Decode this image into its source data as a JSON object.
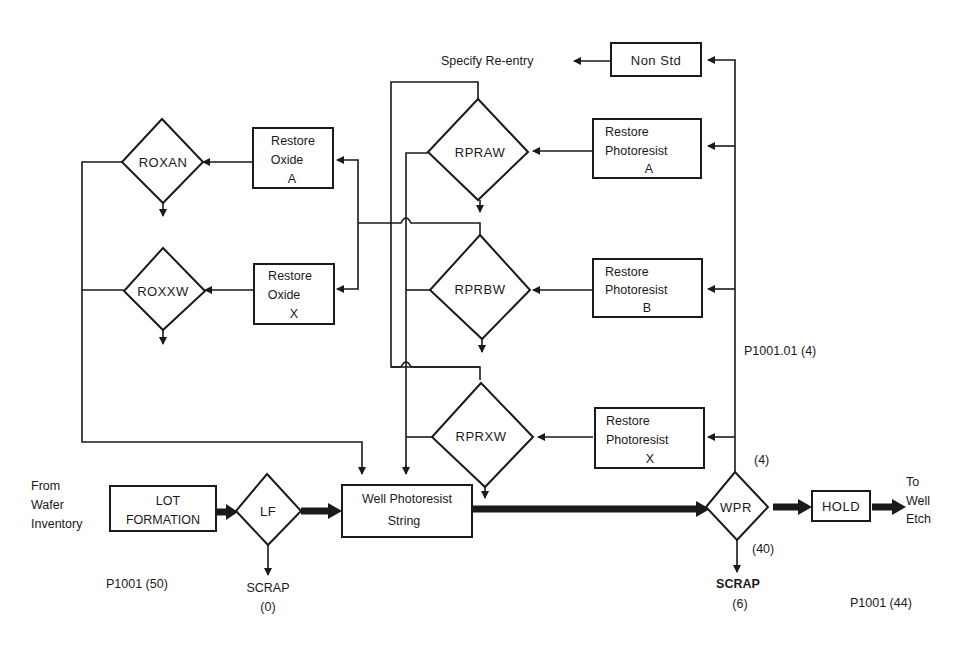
{
  "diagram": {
    "nodes": {
      "lot_formation": {
        "line1": "LOT",
        "line2": "FORMATION"
      },
      "lf": {
        "label": "LF"
      },
      "well_photoresist": {
        "line1": "Well Photoresist",
        "line2": "String"
      },
      "wpr": {
        "label": "WPR"
      },
      "hold": {
        "label": "HOLD"
      },
      "non_std": {
        "label": "Non Std"
      },
      "restore_pr_a": {
        "line1": "Restore",
        "line2": "Photoresist",
        "line3": "A"
      },
      "restore_pr_b": {
        "line1": "Restore",
        "line2": "Photoresist",
        "line3": "B"
      },
      "restore_pr_x": {
        "line1": "Restore",
        "line2": "Photoresist",
        "line3": "X"
      },
      "rpraw": {
        "label": "RPRAW"
      },
      "rprbw": {
        "label": "RPRBW"
      },
      "rprxw": {
        "label": "RPRXW"
      },
      "restore_ox_a": {
        "line1": "Restore",
        "line2": "Oxide",
        "line3": "A"
      },
      "restore_ox_x": {
        "line1": "Restore",
        "line2": "Oxide",
        "line3": "X"
      },
      "roxan": {
        "label": "ROXAN"
      },
      "roxxw": {
        "label": "ROXXW"
      }
    },
    "labels": {
      "from_wafer": [
        "From",
        "Wafer",
        "Inventory"
      ],
      "to_well_etch": [
        "To",
        "Well",
        "Etch"
      ],
      "specify_reentry": "Specify Re-entry",
      "p1001_50": "P1001 (50)",
      "lf_scrap": "SCRAP",
      "lf_scrap_count": "(0)",
      "wpr_scrap": "SCRAP",
      "wpr_scrap_count": "(6)",
      "wpr_up_count": "(4)",
      "wpr_pass_count": "(40)",
      "p1001_01_4": "P1001.01 (4)",
      "p1001_44": "P1001 (44)"
    }
  }
}
